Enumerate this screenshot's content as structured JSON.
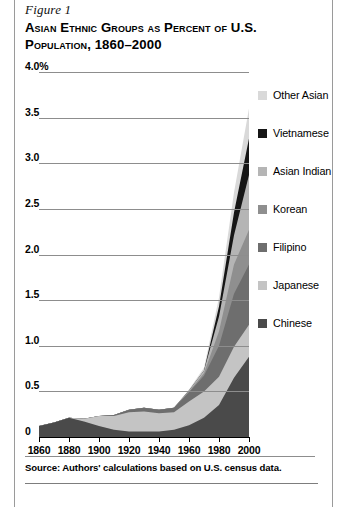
{
  "figure": {
    "label": "Figure 1",
    "title": "Asian Ethnic Groups as Percent of U.S. Population, 1860–2000",
    "source_note": "Source: Authors' calculations based on U.S. census data."
  },
  "chart_data": {
    "type": "area",
    "stacked": true,
    "title": "Asian Ethnic Groups as Percent of U.S. Population, 1860–2000",
    "xlabel": "",
    "ylabel": "",
    "x": [
      1860,
      1870,
      1880,
      1890,
      1900,
      1910,
      1920,
      1930,
      1940,
      1950,
      1960,
      1970,
      1980,
      1990,
      2000
    ],
    "xtick_labels": [
      "1860",
      "1880",
      "1900",
      "1920",
      "1940",
      "1960",
      "1980",
      "2000"
    ],
    "xticks": [
      1860,
      1880,
      1900,
      1920,
      1940,
      1960,
      1980,
      2000
    ],
    "xlim": [
      1860,
      2000
    ],
    "ylim": [
      0,
      4.0
    ],
    "yticks": [
      0,
      0.5,
      1.0,
      1.5,
      2.0,
      2.5,
      3.0,
      3.5,
      4.0
    ],
    "ytick_labels": [
      "0",
      "0.5",
      "1.0",
      "1.5",
      "2.0",
      "2.5",
      "3.0",
      "3.5",
      "4.0%"
    ],
    "grid": "horizontal",
    "legend_position": "right",
    "series": [
      {
        "name": "Chinese",
        "color": "#4a4a4a",
        "values": [
          0.12,
          0.16,
          0.21,
          0.17,
          0.12,
          0.08,
          0.06,
          0.06,
          0.06,
          0.08,
          0.13,
          0.21,
          0.35,
          0.65,
          0.88
        ]
      },
      {
        "name": "Japanese",
        "color": "#c4c4c4",
        "values": [
          0.0,
          0.0,
          0.0,
          0.03,
          0.11,
          0.15,
          0.21,
          0.22,
          0.2,
          0.19,
          0.26,
          0.29,
          0.31,
          0.34,
          0.35
        ]
      },
      {
        "name": "Filipino",
        "color": "#6e6e6e",
        "values": [
          0.0,
          0.0,
          0.0,
          0.0,
          0.0,
          0.01,
          0.03,
          0.04,
          0.04,
          0.05,
          0.1,
          0.17,
          0.34,
          0.58,
          0.66
        ]
      },
      {
        "name": "Korean",
        "color": "#8f8f8f",
        "values": [
          0.0,
          0.0,
          0.0,
          0.0,
          0.0,
          0.0,
          0.0,
          0.0,
          0.0,
          0.0,
          0.01,
          0.03,
          0.16,
          0.32,
          0.38
        ]
      },
      {
        "name": "Asian Indian",
        "color": "#b5b5b5",
        "values": [
          0.0,
          0.0,
          0.0,
          0.0,
          0.0,
          0.0,
          0.0,
          0.0,
          0.0,
          0.0,
          0.01,
          0.03,
          0.16,
          0.32,
          0.6
        ]
      },
      {
        "name": "Vietnamese",
        "color": "#161616",
        "values": [
          0.0,
          0.0,
          0.0,
          0.0,
          0.0,
          0.0,
          0.0,
          0.0,
          0.0,
          0.0,
          0.0,
          0.0,
          0.11,
          0.25,
          0.4
        ]
      },
      {
        "name": "Other Asian",
        "color": "#d9d9d9",
        "values": [
          0.0,
          0.0,
          0.0,
          0.0,
          0.0,
          0.0,
          0.0,
          0.0,
          0.0,
          0.0,
          0.01,
          0.03,
          0.1,
          0.22,
          0.33
        ]
      }
    ],
    "totals": [
      0.12,
      0.16,
      0.21,
      0.2,
      0.23,
      0.24,
      0.3,
      0.32,
      0.3,
      0.32,
      0.52,
      0.76,
      1.53,
      2.68,
      3.6
    ]
  },
  "legend": {
    "items": [
      {
        "label": "Other Asian",
        "color": "#d9d9d9"
      },
      {
        "label": "Vietnamese",
        "color": "#161616"
      },
      {
        "label": "Asian Indian",
        "color": "#b5b5b5"
      },
      {
        "label": "Korean",
        "color": "#8f8f8f"
      },
      {
        "label": "Filipino",
        "color": "#6e6e6e"
      },
      {
        "label": "Japanese",
        "color": "#c4c4c4"
      },
      {
        "label": "Chinese",
        "color": "#4a4a4a"
      }
    ]
  }
}
